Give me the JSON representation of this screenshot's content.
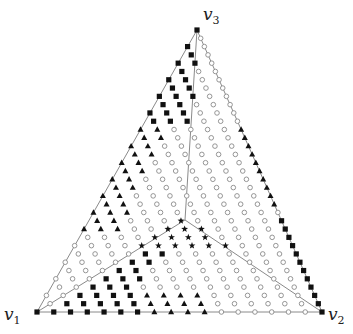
{
  "diagram": {
    "type": "simplex-lattice",
    "vertices": {
      "v1": {
        "label": "v",
        "sub": "1",
        "x": 37,
        "y": 312,
        "label_x": 4,
        "label_y": 306
      },
      "v2": {
        "label": "v",
        "sub": "2",
        "x": 322,
        "y": 312,
        "label_x": 328,
        "label_y": 306
      },
      "v3": {
        "label": "v",
        "sub": "3",
        "x": 197,
        "y": 30,
        "label_x": 203,
        "label_y": 6
      }
    },
    "center": {
      "x": 185,
      "y": 220
    },
    "grid": {
      "N": 34
    },
    "colors": {
      "edge": "#8a8a8a",
      "marker_fill": "#111111",
      "circle_stroke": "#8a8a8a",
      "background": "#ffffff"
    },
    "marker_types": [
      "circle",
      "square",
      "triangle",
      "star"
    ],
    "regions": [
      {
        "name": "star-region",
        "marker": "star",
        "polygon": [
          [
            185,
            214
          ],
          [
            140,
            246
          ],
          [
            230,
            246
          ]
        ]
      },
      {
        "name": "square-top-left",
        "marker": "square",
        "polygon": [
          [
            197,
            24
          ],
          [
            200,
            30
          ],
          [
            194,
            122
          ],
          [
            141,
            122
          ]
        ]
      },
      {
        "name": "triangle-left",
        "marker": "triangle",
        "polygon": [
          [
            141,
            122
          ],
          [
            168,
            122
          ],
          [
            120,
            232
          ],
          [
            78,
            232
          ]
        ]
      },
      {
        "name": "square-bottom-left",
        "marker": "square",
        "polygon": [
          [
            30,
            316
          ],
          [
            37,
            312
          ],
          [
            185,
            222
          ],
          [
            138,
            292
          ],
          [
            138,
            316
          ]
        ]
      },
      {
        "name": "triangle-bottom",
        "marker": "triangle",
        "polygon": [
          [
            138,
            290
          ],
          [
            138,
            316
          ],
          [
            214,
            316
          ],
          [
            214,
            288
          ]
        ]
      },
      {
        "name": "triangle-right",
        "marker": "triangle",
        "polygon": [
          [
            224,
            124
          ],
          [
            252,
            124
          ],
          [
            294,
            212
          ],
          [
            266,
            212
          ]
        ]
      },
      {
        "name": "square-right",
        "marker": "square",
        "polygon": [
          [
            266,
            214
          ],
          [
            296,
            214
          ],
          [
            330,
            316
          ],
          [
            322,
            312
          ]
        ]
      }
    ],
    "lines": [
      {
        "name": "edge-v1-v2",
        "from": "v1",
        "to": "v2"
      },
      {
        "name": "edge-v2-v3",
        "from": "v2",
        "to": "v3"
      },
      {
        "name": "edge-v3-v1",
        "from": "v3",
        "to": "v1"
      },
      {
        "name": "medial-v3-center",
        "from": "v3",
        "to": "center"
      },
      {
        "name": "medial-v1-center",
        "from": "v1",
        "to": "center"
      },
      {
        "name": "medial-v2-center",
        "from": "v2",
        "to": "center"
      }
    ]
  }
}
